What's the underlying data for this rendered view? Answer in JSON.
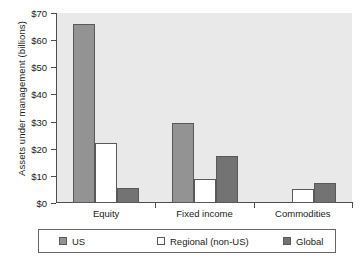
{
  "chart_data": {
    "type": "bar",
    "title": "",
    "subtitle": "",
    "xlabel": "",
    "ylabel": "Assets under management (billions)",
    "categories": [
      "Equity",
      "Fixed income",
      "Commodities"
    ],
    "series": [
      {
        "name": "US",
        "color": "#939393",
        "values": [
          66,
          29.5,
          0
        ]
      },
      {
        "name": "Regional (non-US)",
        "color": "#ffffff",
        "values": [
          22,
          9,
          5
        ]
      },
      {
        "name": "Global",
        "color": "#737373",
        "values": [
          5.5,
          17.5,
          7.5
        ]
      }
    ],
    "ylim": [
      0,
      70
    ],
    "yticks": [
      0,
      10,
      20,
      30,
      40,
      50,
      60,
      70
    ],
    "ytick_labels": [
      "$0",
      "$10",
      "$20",
      "$30",
      "$40",
      "$50",
      "$60",
      "$70"
    ],
    "grid": false,
    "legend_position": "bottom",
    "plot_background": "#e9e9e9",
    "axis_color": "#4d4d4d"
  },
  "legend": {
    "items": [
      {
        "label": "US"
      },
      {
        "label": "Regional (non-US)"
      },
      {
        "label": "Global"
      }
    ]
  }
}
